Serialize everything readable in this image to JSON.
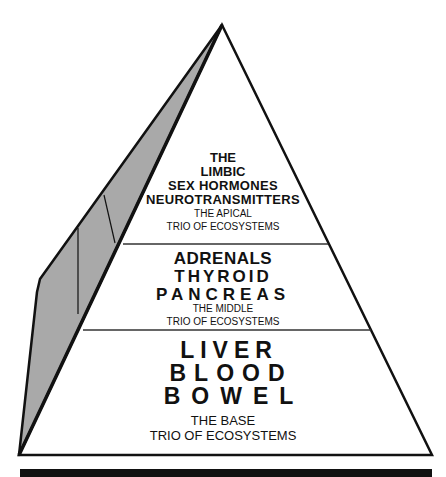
{
  "colors": {
    "outline": "#111111",
    "side_face": "#a9a9a9",
    "background": "#ffffff",
    "bottom_bar": "#111111"
  },
  "pyramid": {
    "apical": {
      "lines": [
        "THE",
        "LIMBIC",
        "SEX HORMONES",
        "NEUROTRANSMITTERS"
      ],
      "caption": [
        "THE APICAL",
        "TRIO OF ECOSYSTEMS"
      ]
    },
    "middle": {
      "lines": [
        "ADRENALS",
        "THYROID",
        "PANCREAS"
      ],
      "caption": [
        "THE MIDDLE",
        "TRIO OF ECOSYSTEMS"
      ]
    },
    "base": {
      "lines": [
        "LIVER",
        "BLOOD",
        "BOWEL"
      ],
      "caption": [
        "THE BASE",
        "TRIO OF ECOSYSTEMS"
      ]
    }
  }
}
